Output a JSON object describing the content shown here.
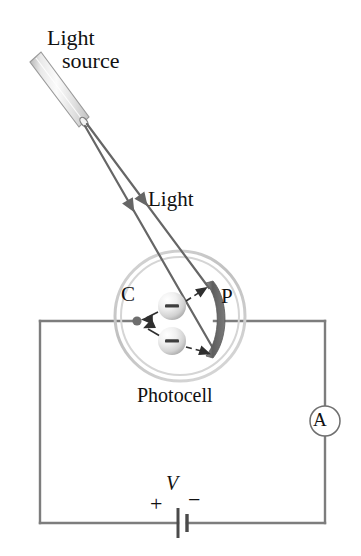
{
  "figure": {
    "labels": {
      "light_source_line1": "Light",
      "light_source_line2": "source",
      "light_ray": "Light",
      "cathode": "C",
      "plate": "P",
      "photocell": "Photocell",
      "voltage": "V",
      "terminal_positive": "+",
      "terminal_negative": "−",
      "ammeter": "A",
      "electron_charge": "−"
    },
    "components": {
      "light_source": {
        "name": "light-source-tube",
        "tip_x": 82,
        "tip_y": 123,
        "tail_x": 32,
        "tail_y": 68,
        "fill_light": "#f4f4f4",
        "fill_dark": "#c9c9c9",
        "outline": "#8a8a8a"
      },
      "light_rays": {
        "name": "light-rays",
        "count": 2,
        "color": "#666666",
        "arrowheads": 2
      },
      "photocell": {
        "name": "photocell-bulb",
        "center_x": 180,
        "center_y": 316,
        "radius_outer": 65,
        "radius_inner": 59,
        "ring_color": "#c4c4c4"
      },
      "cathode_dot": {
        "name": "cathode-electrode",
        "x": 137,
        "y": 321,
        "radius": 4.5,
        "color": "#6e6e6e"
      },
      "anode_plate": {
        "name": "anode-plate",
        "color": "#6b6b6b",
        "top_y": 283,
        "bottom_y": 356
      },
      "electrons": {
        "name": "electron-spheres",
        "count": 2,
        "positions": [
          {
            "x": 172,
            "y": 306,
            "r": 14
          },
          {
            "x": 172,
            "y": 341,
            "r": 14
          }
        ],
        "highlight": "#ffffff",
        "shade": "#bdbdbd"
      },
      "circuit": {
        "name": "circuit-loop",
        "left_x": 40,
        "right_x": 325,
        "top_y": 321,
        "bottom_y": 523,
        "wire_color": "#7d7d7d",
        "wire_width": 2.4
      },
      "ammeter": {
        "name": "ammeter",
        "cx": 325,
        "cy": 421,
        "r": 15
      },
      "battery": {
        "name": "battery",
        "cx": 182,
        "cy": 523,
        "long_plate_half": 15,
        "short_plate_half": 9
      }
    },
    "colors": {
      "ink": "#111111",
      "wire": "#7d7d7d",
      "ray": "#666666",
      "plate": "#6b6b6b",
      "glass": "#c4c4c4"
    }
  }
}
